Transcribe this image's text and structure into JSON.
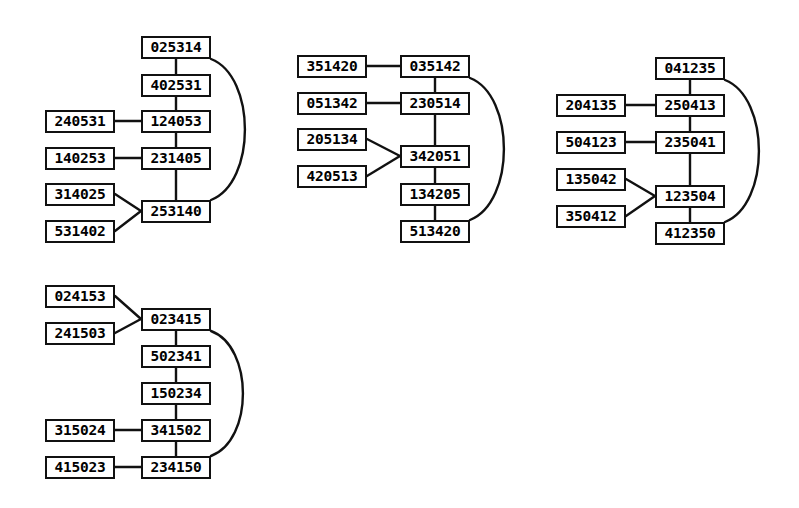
{
  "figure": {
    "background_color": "#ffffff",
    "node_fill_color": "#ffffff",
    "node_border_color": "#111111",
    "edge_color": "#111111",
    "width": 799,
    "height": 508
  },
  "clusters": [
    {
      "id": "cluster-1",
      "nodes": [
        {
          "id": "c1-n0",
          "label": "025314",
          "x": 141,
          "y": 36,
          "w": 70,
          "h": 23
        },
        {
          "id": "c1-n1",
          "label": "402531",
          "x": 141,
          "y": 74,
          "w": 70,
          "h": 23
        },
        {
          "id": "c1-n2",
          "label": "124053",
          "x": 141,
          "y": 110,
          "w": 70,
          "h": 23
        },
        {
          "id": "c1-n3",
          "label": "231405",
          "x": 141,
          "y": 147,
          "w": 70,
          "h": 23
        },
        {
          "id": "c1-n4",
          "label": "253140",
          "x": 141,
          "y": 200,
          "w": 70,
          "h": 23
        },
        {
          "id": "c1-s0",
          "label": "240531",
          "x": 45,
          "y": 110,
          "w": 70,
          "h": 23
        },
        {
          "id": "c1-s1",
          "label": "140253",
          "x": 45,
          "y": 147,
          "w": 70,
          "h": 23
        },
        {
          "id": "c1-s2",
          "label": "314025",
          "x": 45,
          "y": 183,
          "w": 70,
          "h": 23
        },
        {
          "id": "c1-s3",
          "label": "531402",
          "x": 45,
          "y": 220,
          "w": 70,
          "h": 23
        }
      ],
      "edges": [
        {
          "type": "line",
          "from": "c1-n0",
          "to": "c1-n1",
          "x1": 176,
          "y1": 59,
          "x2": 176,
          "y2": 74
        },
        {
          "type": "line",
          "from": "c1-n1",
          "to": "c1-n2",
          "x1": 176,
          "y1": 97,
          "x2": 176,
          "y2": 110
        },
        {
          "type": "line",
          "from": "c1-n2",
          "to": "c1-n3",
          "x1": 176,
          "y1": 133,
          "x2": 176,
          "y2": 147
        },
        {
          "type": "line",
          "from": "c1-n3",
          "to": "c1-n4",
          "x1": 176,
          "y1": 170,
          "x2": 176,
          "y2": 200
        },
        {
          "type": "line",
          "from": "c1-s0",
          "to": "c1-n2",
          "x1": 115,
          "y1": 121,
          "x2": 141,
          "y2": 121
        },
        {
          "type": "line",
          "from": "c1-s1",
          "to": "c1-n3",
          "x1": 115,
          "y1": 158,
          "x2": 141,
          "y2": 158
        },
        {
          "type": "line",
          "from": "c1-s2",
          "to": "c1-n4",
          "x1": 115,
          "y1": 194,
          "x2": 141,
          "y2": 211
        },
        {
          "type": "line",
          "from": "c1-s3",
          "to": "c1-n4",
          "x1": 115,
          "y1": 231,
          "x2": 141,
          "y2": 211
        },
        {
          "type": "arc",
          "from": "c1-n0",
          "to": "c1-n4",
          "x1": 211,
          "y1": 59,
          "x2": 211,
          "y2": 200,
          "bulge": 34
        }
      ]
    },
    {
      "id": "cluster-2",
      "nodes": [
        {
          "id": "c2-n0",
          "label": "035142",
          "x": 400,
          "y": 55,
          "w": 70,
          "h": 23
        },
        {
          "id": "c2-n1",
          "label": "230514",
          "x": 400,
          "y": 92,
          "w": 70,
          "h": 23
        },
        {
          "id": "c2-n2",
          "label": "342051",
          "x": 400,
          "y": 145,
          "w": 70,
          "h": 23
        },
        {
          "id": "c2-n3",
          "label": "134205",
          "x": 400,
          "y": 183,
          "w": 70,
          "h": 23
        },
        {
          "id": "c2-n4",
          "label": "513420",
          "x": 400,
          "y": 220,
          "w": 70,
          "h": 23
        },
        {
          "id": "c2-s0",
          "label": "351420",
          "x": 297,
          "y": 55,
          "w": 70,
          "h": 23
        },
        {
          "id": "c2-s1",
          "label": "051342",
          "x": 297,
          "y": 92,
          "w": 70,
          "h": 23
        },
        {
          "id": "c2-s2",
          "label": "205134",
          "x": 297,
          "y": 128,
          "w": 70,
          "h": 23
        },
        {
          "id": "c2-s3",
          "label": "420513",
          "x": 297,
          "y": 165,
          "w": 70,
          "h": 23
        }
      ],
      "edges": [
        {
          "type": "line",
          "from": "c2-n0",
          "to": "c2-n1",
          "x1": 435,
          "y1": 78,
          "x2": 435,
          "y2": 92
        },
        {
          "type": "line",
          "from": "c2-n1",
          "to": "c2-n2",
          "x1": 435,
          "y1": 115,
          "x2": 435,
          "y2": 145
        },
        {
          "type": "line",
          "from": "c2-n2",
          "to": "c2-n3",
          "x1": 435,
          "y1": 168,
          "x2": 435,
          "y2": 183
        },
        {
          "type": "line",
          "from": "c2-n3",
          "to": "c2-n4",
          "x1": 435,
          "y1": 206,
          "x2": 435,
          "y2": 220
        },
        {
          "type": "line",
          "from": "c2-s0",
          "to": "c2-n0",
          "x1": 367,
          "y1": 66,
          "x2": 400,
          "y2": 66
        },
        {
          "type": "line",
          "from": "c2-s1",
          "to": "c2-n1",
          "x1": 367,
          "y1": 103,
          "x2": 400,
          "y2": 103
        },
        {
          "type": "line",
          "from": "c2-s2",
          "to": "c2-n2",
          "x1": 367,
          "y1": 139,
          "x2": 400,
          "y2": 156
        },
        {
          "type": "line",
          "from": "c2-s3",
          "to": "c2-n2",
          "x1": 367,
          "y1": 176,
          "x2": 400,
          "y2": 156
        },
        {
          "type": "arc",
          "from": "c2-n0",
          "to": "c2-n4",
          "x1": 470,
          "y1": 78,
          "x2": 470,
          "y2": 220,
          "bulge": 34
        }
      ]
    },
    {
      "id": "cluster-3",
      "nodes": [
        {
          "id": "c3-n0",
          "label": "041235",
          "x": 655,
          "y": 57,
          "w": 70,
          "h": 23
        },
        {
          "id": "c3-n1",
          "label": "250413",
          "x": 655,
          "y": 94,
          "w": 70,
          "h": 23
        },
        {
          "id": "c3-n2",
          "label": "235041",
          "x": 655,
          "y": 131,
          "w": 70,
          "h": 23
        },
        {
          "id": "c3-n3",
          "label": "123504",
          "x": 655,
          "y": 185,
          "w": 70,
          "h": 23
        },
        {
          "id": "c3-n4",
          "label": "412350",
          "x": 655,
          "y": 222,
          "w": 70,
          "h": 23
        },
        {
          "id": "c3-s0",
          "label": "204135",
          "x": 556,
          "y": 94,
          "w": 70,
          "h": 23
        },
        {
          "id": "c3-s1",
          "label": "504123",
          "x": 556,
          "y": 131,
          "w": 70,
          "h": 23
        },
        {
          "id": "c3-s2",
          "label": "135042",
          "x": 556,
          "y": 168,
          "w": 70,
          "h": 23
        },
        {
          "id": "c3-s3",
          "label": "350412",
          "x": 556,
          "y": 205,
          "w": 70,
          "h": 23
        }
      ],
      "edges": [
        {
          "type": "line",
          "from": "c3-n0",
          "to": "c3-n1",
          "x1": 690,
          "y1": 80,
          "x2": 690,
          "y2": 94
        },
        {
          "type": "line",
          "from": "c3-n1",
          "to": "c3-n2",
          "x1": 690,
          "y1": 117,
          "x2": 690,
          "y2": 131
        },
        {
          "type": "line",
          "from": "c3-n2",
          "to": "c3-n3",
          "x1": 690,
          "y1": 154,
          "x2": 690,
          "y2": 185
        },
        {
          "type": "line",
          "from": "c3-n3",
          "to": "c3-n4",
          "x1": 690,
          "y1": 208,
          "x2": 690,
          "y2": 222
        },
        {
          "type": "line",
          "from": "c3-s0",
          "to": "c3-n1",
          "x1": 626,
          "y1": 105,
          "x2": 655,
          "y2": 105
        },
        {
          "type": "line",
          "from": "c3-s1",
          "to": "c3-n2",
          "x1": 626,
          "y1": 142,
          "x2": 655,
          "y2": 142
        },
        {
          "type": "line",
          "from": "c3-s2",
          "to": "c3-n3",
          "x1": 626,
          "y1": 179,
          "x2": 655,
          "y2": 196
        },
        {
          "type": "line",
          "from": "c3-s3",
          "to": "c3-n3",
          "x1": 626,
          "y1": 216,
          "x2": 655,
          "y2": 196
        },
        {
          "type": "arc",
          "from": "c3-n0",
          "to": "c3-n4",
          "x1": 725,
          "y1": 80,
          "x2": 725,
          "y2": 222,
          "bulge": 34
        }
      ]
    },
    {
      "id": "cluster-4",
      "nodes": [
        {
          "id": "c4-n0",
          "label": "023415",
          "x": 141,
          "y": 308,
          "w": 70,
          "h": 23
        },
        {
          "id": "c4-n1",
          "label": "502341",
          "x": 141,
          "y": 345,
          "w": 70,
          "h": 23
        },
        {
          "id": "c4-n2",
          "label": "150234",
          "x": 141,
          "y": 382,
          "w": 70,
          "h": 23
        },
        {
          "id": "c4-n3",
          "label": "341502",
          "x": 141,
          "y": 419,
          "w": 70,
          "h": 23
        },
        {
          "id": "c4-n4",
          "label": "234150",
          "x": 141,
          "y": 456,
          "w": 70,
          "h": 23
        },
        {
          "id": "c4-s0",
          "label": "024153",
          "x": 45,
          "y": 285,
          "w": 70,
          "h": 23
        },
        {
          "id": "c4-s1",
          "label": "241503",
          "x": 45,
          "y": 322,
          "w": 70,
          "h": 23
        },
        {
          "id": "c4-s2",
          "label": "315024",
          "x": 45,
          "y": 419,
          "w": 70,
          "h": 23
        },
        {
          "id": "c4-s3",
          "label": "415023",
          "x": 45,
          "y": 456,
          "w": 70,
          "h": 23
        }
      ],
      "edges": [
        {
          "type": "line",
          "from": "c4-n0",
          "to": "c4-n1",
          "x1": 176,
          "y1": 331,
          "x2": 176,
          "y2": 345
        },
        {
          "type": "line",
          "from": "c4-n1",
          "to": "c4-n2",
          "x1": 176,
          "y1": 368,
          "x2": 176,
          "y2": 382
        },
        {
          "type": "line",
          "from": "c4-n2",
          "to": "c4-n3",
          "x1": 176,
          "y1": 405,
          "x2": 176,
          "y2": 419
        },
        {
          "type": "line",
          "from": "c4-n3",
          "to": "c4-n4",
          "x1": 176,
          "y1": 442,
          "x2": 176,
          "y2": 456
        },
        {
          "type": "line",
          "from": "c4-s0",
          "to": "c4-n0",
          "x1": 115,
          "y1": 296,
          "x2": 141,
          "y2": 319
        },
        {
          "type": "line",
          "from": "c4-s1",
          "to": "c4-n0",
          "x1": 115,
          "y1": 333,
          "x2": 141,
          "y2": 319
        },
        {
          "type": "line",
          "from": "c4-s2",
          "to": "c4-n3",
          "x1": 115,
          "y1": 430,
          "x2": 141,
          "y2": 430
        },
        {
          "type": "line",
          "from": "c4-s3",
          "to": "c4-n4",
          "x1": 115,
          "y1": 467,
          "x2": 141,
          "y2": 467
        },
        {
          "type": "arc",
          "from": "c4-n0",
          "to": "c4-n4",
          "x1": 211,
          "y1": 331,
          "x2": 211,
          "y2": 456,
          "bulge": 32
        }
      ]
    }
  ]
}
